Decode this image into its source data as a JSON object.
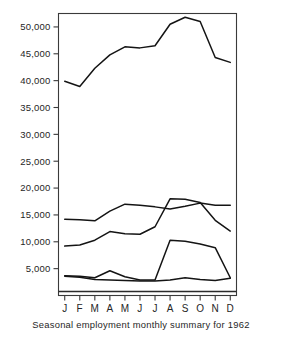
{
  "figure": {
    "caption": "Seasonal employment monthly summary for 1962"
  },
  "chart_data": {
    "type": "line",
    "title": "Seasonal employment monthly summary for 1962",
    "xlabel": "",
    "ylabel": "",
    "categories": [
      "J",
      "F",
      "M",
      "A",
      "M",
      "J",
      "J",
      "A",
      "S",
      "O",
      "N",
      "D"
    ],
    "month_names": [
      "January",
      "February",
      "March",
      "April",
      "May",
      "June",
      "July",
      "August",
      "September",
      "October",
      "November",
      "December"
    ],
    "ylim": [
      0,
      52500
    ],
    "ytick_values": [
      5000,
      10000,
      15000,
      20000,
      25000,
      30000,
      35000,
      40000,
      45000,
      50000
    ],
    "ytick_labels": [
      "5,000",
      "10,000",
      "15,000",
      "20,000",
      "25,000",
      "30,000",
      "35,000",
      "40,000",
      "45,000",
      "50,000"
    ],
    "grid": false,
    "legend": "none",
    "series": [
      {
        "name": "total-employment",
        "values": [
          39900,
          38900,
          42300,
          44800,
          46300,
          46100,
          46500,
          50500,
          51800,
          51000,
          44300,
          43400
        ]
      },
      {
        "name": "series-upper-middle",
        "values": [
          14200,
          14100,
          13900,
          15700,
          17000,
          16800,
          16500,
          16100,
          16600,
          17200,
          16800,
          16800
        ]
      },
      {
        "name": "series-lower-middle",
        "values": [
          9200,
          9400,
          10300,
          11900,
          11500,
          11400,
          12800,
          18000,
          17900,
          17300,
          14000,
          12000
        ]
      },
      {
        "name": "series-seasonal-spike",
        "values": [
          3700,
          3600,
          3300,
          4600,
          3500,
          2900,
          2900,
          10300,
          10100,
          9600,
          8900,
          3300
        ]
      },
      {
        "name": "series-baseline-low",
        "values": [
          3600,
          3400,
          3000,
          2900,
          2800,
          2700,
          2700,
          2900,
          3300,
          3000,
          2800,
          3200
        ]
      }
    ]
  }
}
